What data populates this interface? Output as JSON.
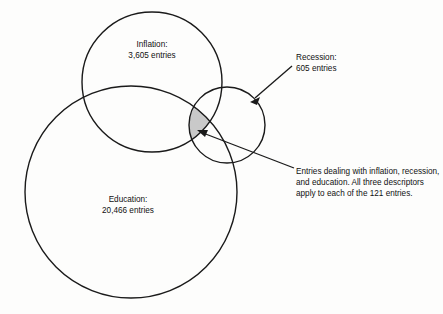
{
  "diagram": {
    "type": "venn",
    "title": "",
    "background_color": "#fdfdfc",
    "stroke_color": "#1a1a1a",
    "shaded_region_color": "#c9c9c9",
    "sets": [
      {
        "key": "inflation",
        "name": "Inflation",
        "label": "Inflation:\n3,605 entries",
        "count_text": "3,605 entries",
        "count": 3605,
        "center_x": 152,
        "center_y": 82,
        "radius": 70
      },
      {
        "key": "education",
        "name": "Education",
        "label": "Education:\n20,466 entries",
        "count_text": "20,466 entries",
        "count": 20466,
        "center_x": 131,
        "center_y": 192,
        "radius": 106
      },
      {
        "key": "recession",
        "name": "Recession",
        "label": "Recession:\n605 entries",
        "count_text": "605 entries",
        "count": 605,
        "center_x": 227,
        "center_y": 125,
        "radius": 38
      }
    ],
    "intersection": {
      "key": "inflation-recession-education",
      "label": "Entries dealing with inflation, recession, and education. All three descriptors apply to each of the 121 entries.",
      "count": 121,
      "fill_color": "#c9c9c9"
    },
    "annotations": [
      {
        "key": "recession-callout",
        "target": "recession-circle",
        "from_x": 292,
        "from_y": 66,
        "to_x": 252,
        "to_y": 100
      },
      {
        "key": "triple-callout",
        "target": "shaded-intersection",
        "from_x": 294,
        "from_y": 168,
        "to_x": 198,
        "to_y": 130
      }
    ]
  }
}
